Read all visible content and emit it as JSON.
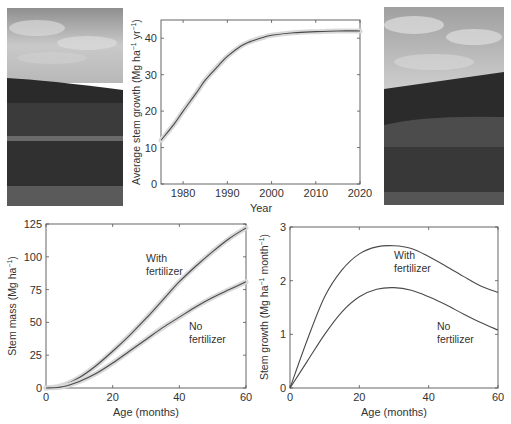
{
  "photos": [
    {
      "name": "forest-photo-left",
      "description": "Eucalyptus plantation landscape under cloudy sky"
    },
    {
      "name": "forest-photo-right",
      "description": "Eucalyptus plantation hillside under cloudy sky"
    }
  ],
  "chart_data": [
    {
      "type": "line",
      "title": "",
      "xlabel": "Year",
      "ylabel": "Average stem growth (Mg ha⁻¹ yr⁻¹)",
      "xlim": [
        1975,
        2020
      ],
      "ylim": [
        0,
        45
      ],
      "xticks": [
        1980,
        1990,
        2000,
        2010,
        2020
      ],
      "yticks": [
        0,
        10,
        20,
        30,
        40
      ],
      "grid": false,
      "confidence_band": true,
      "series": [
        {
          "name": "Average stem growth",
          "x": [
            1975,
            1978,
            1980,
            1983,
            1985,
            1988,
            1990,
            1993,
            1995,
            1998,
            2000,
            2005,
            2010,
            2015,
            2020
          ],
          "values": [
            12,
            16.5,
            20,
            25,
            28.5,
            32.5,
            35,
            37.8,
            39,
            40.2,
            40.8,
            41.5,
            41.8,
            42,
            42
          ]
        }
      ]
    },
    {
      "type": "line",
      "title": "",
      "xlabel": "Age (months)",
      "ylabel": "Stem mass (Mg ha⁻¹)",
      "xlim": [
        0,
        60
      ],
      "ylim": [
        0,
        125
      ],
      "xticks": [
        0,
        20,
        40,
        60
      ],
      "yticks": [
        0,
        25,
        50,
        75,
        100,
        125
      ],
      "grid": false,
      "confidence_band": true,
      "annotations": [
        "With fertilizer",
        "No fertilizer"
      ],
      "series": [
        {
          "name": "With fertilizer",
          "x": [
            0,
            5,
            10,
            15,
            20,
            25,
            30,
            35,
            40,
            45,
            50,
            55,
            60
          ],
          "values": [
            0,
            2,
            8,
            17,
            28,
            40,
            53,
            67,
            81,
            93,
            104,
            114,
            122
          ]
        },
        {
          "name": "No fertilizer",
          "x": [
            0,
            5,
            10,
            15,
            20,
            25,
            30,
            35,
            40,
            45,
            50,
            55,
            60
          ],
          "values": [
            0,
            1,
            5,
            11,
            19,
            28,
            37,
            46,
            54,
            62,
            69,
            75,
            81
          ]
        }
      ]
    },
    {
      "type": "line",
      "title": "",
      "xlabel": "Age (months)",
      "ylabel": "Stem growth (Mg ha⁻¹ month⁻¹)",
      "xlim": [
        0,
        60
      ],
      "ylim": [
        0,
        3
      ],
      "xticks": [
        0,
        20,
        40,
        60
      ],
      "yticks": [
        0,
        1,
        2,
        3
      ],
      "grid": false,
      "annotations": [
        "With fertilizer",
        "No fertilizer"
      ],
      "series": [
        {
          "name": "With fertilizer",
          "x": [
            0,
            5,
            10,
            15,
            20,
            25,
            30,
            35,
            40,
            45,
            50,
            55,
            60
          ],
          "values": [
            0,
            0.9,
            1.7,
            2.2,
            2.5,
            2.63,
            2.65,
            2.6,
            2.45,
            2.27,
            2.08,
            1.9,
            1.78
          ]
        },
        {
          "name": "No fertilizer",
          "x": [
            0,
            5,
            10,
            15,
            20,
            25,
            30,
            35,
            40,
            45,
            50,
            55,
            60
          ],
          "values": [
            0,
            0.5,
            1.0,
            1.42,
            1.7,
            1.84,
            1.87,
            1.82,
            1.7,
            1.55,
            1.38,
            1.22,
            1.08
          ]
        }
      ]
    }
  ],
  "labels": {
    "top": {
      "xlabel": "Year",
      "ylabel_main": "Average stem growth (Mg ha",
      "ylabel_sup1": "−1",
      "ylabel_mid": " yr",
      "ylabel_sup2": "−1",
      "ylabel_end": ")"
    },
    "left": {
      "xlabel": "Age (months)",
      "ylabel_main": "Stem mass (Mg ha",
      "ylabel_sup": "−1",
      "ylabel_end": ")",
      "ann_with_1": "With",
      "ann_with_2": "fertilizer",
      "ann_no_1": "No",
      "ann_no_2": "fertilizer"
    },
    "right": {
      "xlabel": "Age (months)",
      "ylabel_main": "Stem growth (Mg ha",
      "ylabel_sup1": "−1",
      "ylabel_mid": " month",
      "ylabel_sup2": "−1",
      "ylabel_end": ")",
      "ann_with_1": "With",
      "ann_with_2": "fertilizer",
      "ann_no_1": "No",
      "ann_no_2": "fertilizer"
    }
  }
}
